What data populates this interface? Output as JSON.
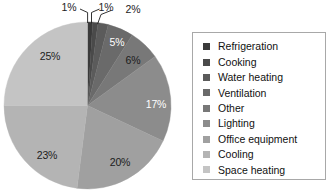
{
  "chart_data": {
    "type": "pie",
    "title": "",
    "categories": [
      "Refrigeration",
      "Cooking",
      "Water heating",
      "Ventilation",
      "Other",
      "Lighting",
      "Office equipment",
      "Cooling",
      "Space heating"
    ],
    "values": [
      1,
      1,
      2,
      5,
      6,
      17,
      20,
      23,
      25
    ],
    "value_labels": [
      "1%",
      "1%",
      "2%",
      "5%",
      "6%",
      "17%",
      "20%",
      "23%",
      "25%"
    ],
    "unit": "%",
    "start_angle_deg": 0,
    "direction": "clockwise",
    "legend_position": "right",
    "grid": false,
    "colors": [
      "#3a3a3a",
      "#4a4a4a",
      "#5b5b5b",
      "#6a6a6a",
      "#787878",
      "#8c8c8c",
      "#a0a0a0",
      "#b4b4b4",
      "#c4c4c4"
    ],
    "label_text_colors": [
      "#1c1c1c",
      "#1c1c1c",
      "#1c1c1c",
      "#ffffff",
      "#1c1c1c",
      "#ffffff",
      "#1c1c1c",
      "#1c1c1c",
      "#1c1c1c"
    ],
    "callout_slices": [
      "Refrigeration",
      "Cooking",
      "Water heating"
    ]
  },
  "legend": {
    "items": [
      {
        "label": "Refrigeration",
        "color": "#3a3a3a"
      },
      {
        "label": "Cooking",
        "color": "#4a4a4a"
      },
      {
        "label": "Water heating",
        "color": "#5b5b5b"
      },
      {
        "label": "Ventilation",
        "color": "#6a6a6a"
      },
      {
        "label": "Other",
        "color": "#787878"
      },
      {
        "label": "Lighting",
        "color": "#8c8c8c"
      },
      {
        "label": "Office equipment",
        "color": "#a0a0a0"
      },
      {
        "label": "Cooling",
        "color": "#b4b4b4"
      },
      {
        "label": "Space heating",
        "color": "#c4c4c4"
      }
    ]
  },
  "pie": {
    "labels": {
      "refrigeration": "1%",
      "cooking": "1%",
      "water_heating": "2%",
      "ventilation": "5%",
      "other": "6%",
      "lighting": "17%",
      "office_equipment": "20%",
      "cooling": "23%",
      "space_heating": "25%"
    }
  }
}
